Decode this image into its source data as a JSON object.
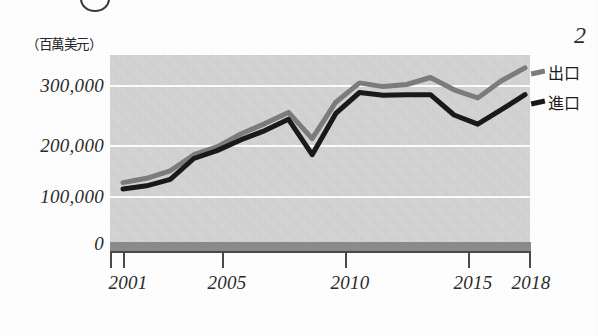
{
  "figure": {
    "badge_icon": "circled-number-partial",
    "corner_number": "2",
    "unit_label": "（百萬美元）"
  },
  "legend": {
    "position": "right",
    "items": [
      {
        "label": "出口",
        "color": "#7d7d7d",
        "swatch_icon": "line-swatch-export"
      },
      {
        "label": "進口",
        "color": "#1a1a1a",
        "swatch_icon": "line-swatch-import"
      }
    ]
  },
  "axes": {
    "y_ticks": [
      "300,000",
      "200,000",
      "100,000",
      "0"
    ],
    "x_ticks": [
      "2001",
      "2005",
      "2010",
      "2015",
      "2018"
    ]
  },
  "chart_data": {
    "type": "line",
    "title": "",
    "subtitle": "",
    "xlabel": "",
    "ylabel": "（百萬美元）",
    "ylim": [
      0,
      360000
    ],
    "xlim": [
      2001,
      2018
    ],
    "grid": true,
    "gridlines": [
      100000,
      200000,
      300000
    ],
    "legend_position": "right",
    "x": [
      2001,
      2002,
      2003,
      2004,
      2005,
      2006,
      2007,
      2008,
      2009,
      2010,
      2011,
      2012,
      2013,
      2014,
      2015,
      2016,
      2017,
      2018
    ],
    "categories": [
      "2001",
      "2002",
      "2003",
      "2004",
      "2005",
      "2006",
      "2007",
      "2008",
      "2009",
      "2010",
      "2011",
      "2012",
      "2013",
      "2014",
      "2015",
      "2016",
      "2017",
      "2018"
    ],
    "series": [
      {
        "name": "出口",
        "color": "#7d7d7d",
        "values": [
          122000,
          130000,
          144000,
          174000,
          189000,
          213000,
          232000,
          253000,
          204000,
          272000,
          308000,
          301000,
          305000,
          318000,
          295000,
          280000,
          312000,
          336000
        ]
      },
      {
        "name": "進口",
        "color": "#1a1a1a",
        "values": [
          110000,
          116000,
          128000,
          167000,
          182000,
          202000,
          219000,
          240000,
          174000,
          251000,
          290000,
          285000,
          286000,
          286000,
          248000,
          231000,
          258000,
          286000
        ]
      }
    ]
  }
}
